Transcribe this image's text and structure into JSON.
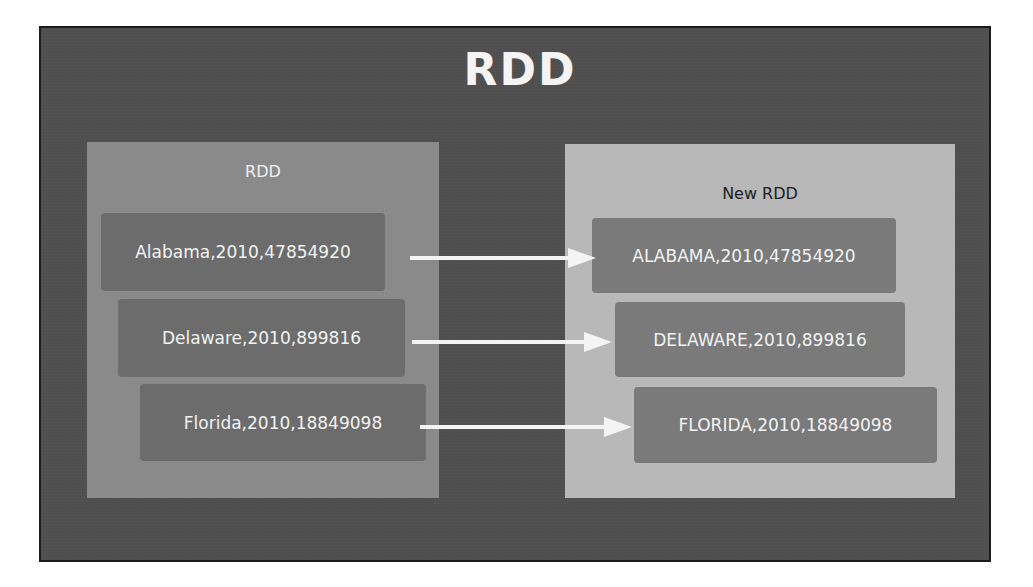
{
  "title": "RDD",
  "source_panel": {
    "label": "RDD",
    "records": [
      "Alabama,2010,47854920",
      "Delaware,2010,899816",
      "Florida,2010,18849098"
    ]
  },
  "target_panel": {
    "label": "New RDD",
    "records": [
      "ALABAMA,2010,47854920",
      "DELAWARE,2010,899816",
      "FLORIDA,2010,18849098"
    ]
  },
  "colors": {
    "background": "#4f4f4f",
    "source_panel": "#8a8a8a",
    "target_panel": "#b8b8b8",
    "record_box": "#6c6c6c",
    "arrow": "#f4f4f4"
  }
}
